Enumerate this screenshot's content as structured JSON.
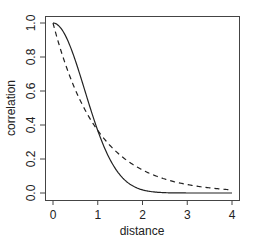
{
  "chart_data": {
    "type": "line",
    "title": "",
    "xlabel": "distance",
    "ylabel": "correlation",
    "xlim": [
      0,
      4
    ],
    "ylim": [
      0,
      1
    ],
    "x_ticks": [
      "0",
      "1",
      "2",
      "3",
      "4"
    ],
    "y_ticks": [
      "0.0",
      "0.2",
      "0.4",
      "0.6",
      "0.8",
      "1.0"
    ],
    "grid": false,
    "legend": null,
    "series": [
      {
        "name": "solid (Gaussian-type)",
        "style": "solid",
        "x": [
          0,
          0.25,
          0.5,
          0.75,
          1.0,
          1.25,
          1.5,
          1.75,
          2.0,
          2.5,
          3.0,
          3.5,
          4.0
        ],
        "values": [
          1.0,
          0.94,
          0.78,
          0.57,
          0.37,
          0.21,
          0.11,
          0.05,
          0.02,
          0.0,
          0.0,
          0.0,
          0.0
        ]
      },
      {
        "name": "dashed (exponential-type)",
        "style": "dashed",
        "x": [
          0,
          0.25,
          0.5,
          0.75,
          1.0,
          1.25,
          1.5,
          1.75,
          2.0,
          2.5,
          3.0,
          3.5,
          4.0
        ],
        "values": [
          1.0,
          0.78,
          0.61,
          0.47,
          0.37,
          0.29,
          0.22,
          0.17,
          0.14,
          0.08,
          0.05,
          0.03,
          0.02
        ]
      }
    ]
  }
}
